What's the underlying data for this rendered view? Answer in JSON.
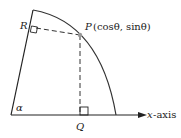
{
  "diagram": {
    "labels": {
      "R": "R",
      "P_name": "P",
      "P_coords": "(cosθ, sinθ)",
      "Q": "Q",
      "alpha": "α",
      "x_var": "x",
      "x_axis_suffix": "-axis"
    },
    "colors": {
      "line": "#222222",
      "arc": "#333333",
      "point": "#999999",
      "dashed": "#333333"
    }
  }
}
